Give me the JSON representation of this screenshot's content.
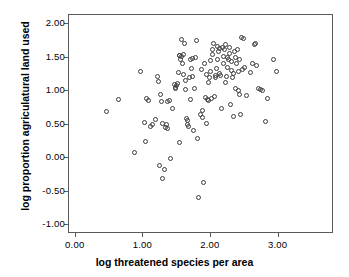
{
  "chart_data": {
    "type": "scatter",
    "title": "",
    "xlabel": "log threatened species per area",
    "ylabel": "log proportion agriculatural land used",
    "xlim": [
      -0.1,
      3.82
    ],
    "ylim": [
      -1.13,
      2.14
    ],
    "xticks": [
      "0.00",
      "1.00",
      "2.00",
      "3.00"
    ],
    "xtick_values": [
      0.0,
      1.0,
      2.0,
      3.0
    ],
    "yticks": [
      "2.00",
      "1.50",
      "1.00",
      "0.50",
      "0.00",
      "-0.50",
      "-1.00"
    ],
    "ytick_values": [
      2.0,
      1.5,
      1.0,
      0.5,
      0.0,
      -0.5,
      -1.0
    ],
    "grid": false,
    "legend": "none",
    "marker": "open-circle",
    "marker_color": "#3c3c3c",
    "frame_color": "#5a5a5a",
    "background": "#ffffff",
    "n_points": 132,
    "points": [
      [
        0.45,
        0.7
      ],
      [
        0.63,
        0.88
      ],
      [
        0.87,
        0.09
      ],
      [
        0.96,
        1.29
      ],
      [
        1.01,
        0.54
      ],
      [
        1.03,
        0.25
      ],
      [
        1.05,
        0.9
      ],
      [
        1.08,
        0.86
      ],
      [
        1.11,
        0.47
      ],
      [
        1.14,
        0.51
      ],
      [
        1.18,
        0.58
      ],
      [
        1.21,
        1.22
      ],
      [
        1.22,
        1.14
      ],
      [
        1.24,
        -0.1
      ],
      [
        1.25,
        0.96
      ],
      [
        1.27,
        0.85
      ],
      [
        1.28,
        0.52
      ],
      [
        1.29,
        -0.3
      ],
      [
        1.31,
        -0.17
      ],
      [
        1.33,
        0.46
      ],
      [
        1.34,
        0.5
      ],
      [
        1.35,
        0.85
      ],
      [
        1.36,
        0.44
      ],
      [
        1.38,
        0.86
      ],
      [
        1.4,
        0.0
      ],
      [
        1.43,
        0.74
      ],
      [
        1.46,
        1.1
      ],
      [
        1.47,
        1.06
      ],
      [
        1.48,
        1.04
      ],
      [
        1.49,
        1.09
      ],
      [
        1.5,
        1.11
      ],
      [
        1.52,
        1.28
      ],
      [
        1.53,
        0.24
      ],
      [
        1.54,
        1.53
      ],
      [
        1.55,
        1.47
      ],
      [
        1.56,
        1.52
      ],
      [
        1.57,
        1.77
      ],
      [
        1.58,
        1.42
      ],
      [
        1.59,
        1.55
      ],
      [
        1.6,
        1.25
      ],
      [
        1.61,
        1.72
      ],
      [
        1.62,
        1.03
      ],
      [
        1.63,
        1.16
      ],
      [
        1.64,
        0.6
      ],
      [
        1.65,
        0.51
      ],
      [
        1.66,
        0.57
      ],
      [
        1.67,
        0.47
      ],
      [
        1.68,
        1.2
      ],
      [
        1.69,
        0.88
      ],
      [
        1.7,
        1.47
      ],
      [
        1.71,
        1.34
      ],
      [
        1.72,
        1.49
      ],
      [
        1.73,
        1.22
      ],
      [
        1.74,
        0.42
      ],
      [
        1.75,
        1.05
      ],
      [
        1.77,
        1.5
      ],
      [
        1.78,
        1.76
      ],
      [
        1.8,
        0.29
      ],
      [
        1.82,
        -0.59
      ],
      [
        1.84,
        0.65
      ],
      [
        1.86,
        1.33
      ],
      [
        1.87,
        0.72
      ],
      [
        1.88,
        0.61
      ],
      [
        1.89,
        -0.36
      ],
      [
        1.9,
        1.41
      ],
      [
        1.92,
        0.91
      ],
      [
        1.93,
        0.52
      ],
      [
        1.94,
        1.25
      ],
      [
        1.95,
        0.88
      ],
      [
        1.96,
        1.13
      ],
      [
        1.97,
        0.87
      ],
      [
        1.98,
        1.21
      ],
      [
        1.99,
        1.46
      ],
      [
        2.0,
        1.3
      ],
      [
        2.01,
        0.89
      ],
      [
        2.02,
        1.62
      ],
      [
        2.03,
        1.55
      ],
      [
        2.04,
        1.72
      ],
      [
        2.05,
        0.93
      ],
      [
        2.06,
        1.24
      ],
      [
        2.07,
        1.21
      ],
      [
        2.08,
        1.34
      ],
      [
        2.09,
        1.48
      ],
      [
        2.1,
        1.67
      ],
      [
        2.11,
        1.59
      ],
      [
        2.12,
        1.64
      ],
      [
        2.13,
        1.27
      ],
      [
        2.14,
        1.23
      ],
      [
        2.15,
        0.75
      ],
      [
        2.17,
        1.65
      ],
      [
        2.18,
        1.52
      ],
      [
        2.19,
        1.41
      ],
      [
        2.2,
        1.62
      ],
      [
        2.21,
        1.7
      ],
      [
        2.22,
        1.13
      ],
      [
        2.23,
        1.22
      ],
      [
        2.24,
        1.36
      ],
      [
        2.25,
        1.5
      ],
      [
        2.26,
        1.48
      ],
      [
        2.27,
        1.66
      ],
      [
        2.28,
        1.57
      ],
      [
        2.29,
        0.81
      ],
      [
        2.3,
        1.31
      ],
      [
        2.31,
        1.44
      ],
      [
        2.32,
        1.21
      ],
      [
        2.33,
        1.27
      ],
      [
        2.34,
        0.62
      ],
      [
        2.35,
        1.59
      ],
      [
        2.36,
        1.5
      ],
      [
        2.37,
        1.04
      ],
      [
        2.38,
        1.41
      ],
      [
        2.39,
        1.62
      ],
      [
        2.4,
        1.02
      ],
      [
        2.41,
        1.29
      ],
      [
        2.42,
        0.95
      ],
      [
        2.44,
        0.66
      ],
      [
        2.45,
        1.81
      ],
      [
        2.46,
        1.33
      ],
      [
        2.48,
        1.79
      ],
      [
        2.5,
        1.35
      ],
      [
        2.53,
        0.94
      ],
      [
        2.58,
        1.28
      ],
      [
        2.61,
        1.42
      ],
      [
        2.64,
        1.7
      ],
      [
        2.66,
        1.71
      ],
      [
        2.68,
        1.38
      ],
      [
        2.7,
        1.05
      ],
      [
        2.74,
        1.03
      ],
      [
        2.76,
        1.02
      ],
      [
        2.8,
        0.55
      ],
      [
        2.83,
        0.9
      ],
      [
        2.93,
        1.47
      ],
      [
        2.97,
        1.3
      ],
      [
        2.42,
        1.47
      ]
    ],
    "highlighted_point": [
      1.54,
      1.53
    ]
  }
}
